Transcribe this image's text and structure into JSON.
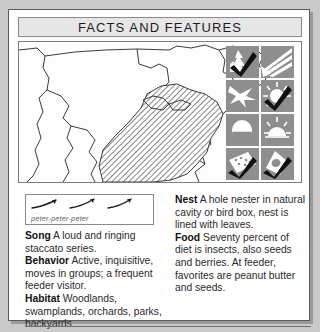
{
  "header": {
    "title": "FACTS AND FEATURES"
  },
  "map": {
    "name": "range-map",
    "description": "North America range map with hatched breeding range over eastern United States",
    "region_fill": "#b8b8b8",
    "outline_color": "#3a3a3a",
    "background": "#fdfdfd"
  },
  "icon_grid": {
    "background": "#8e8e8e",
    "check_color": "#111111",
    "icons": [
      {
        "name": "conifer-tree-icon",
        "label": "Woodland habitat",
        "checked": true
      },
      {
        "name": "open-field-icon",
        "label": "Open field habitat",
        "checked": false
      },
      {
        "name": "bird-flight-icon",
        "label": "Flight pattern",
        "checked": false
      },
      {
        "name": "sun-feeder-icon",
        "label": "Feeder visitor",
        "checked": true
      },
      {
        "name": "half-circle-icon",
        "label": "Ground feeding",
        "checked": false
      },
      {
        "name": "sunrise-dome-icon",
        "label": "Shrub nesting",
        "checked": false
      },
      {
        "name": "open-nest-icon",
        "label": "Open cup nest",
        "checked": true
      },
      {
        "name": "cavity-nest-icon",
        "label": "Cavity nest box",
        "checked": true
      }
    ]
  },
  "sonogram": {
    "name": "song-sonogram",
    "label": "peter-peter-peter",
    "stroke": "#1a1a1a"
  },
  "left_column": [
    {
      "label": "Song",
      "text": "A loud and ringing staccato series."
    },
    {
      "label": "Behavior",
      "text": "Active, inquisitive, moves in groups; a frequent feeder visitor."
    },
    {
      "label": "Habitat",
      "text": "Woodlands, swamplands, orchards, parks, backyards."
    }
  ],
  "right_column": [
    {
      "label": "Nest",
      "text": "A hole nester in natural cavity or bird box, nest is lined with leaves."
    },
    {
      "label": "Food",
      "text": "Seventy percent of diet is insects, also seeds and berries. At feeder, favorites are peanut butter and seeds."
    }
  ]
}
